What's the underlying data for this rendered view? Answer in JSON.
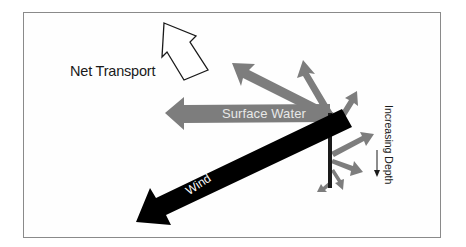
{
  "diagram": {
    "labels": {
      "net_transport": "Net Transport",
      "surface_water": "Surface Water",
      "wind": "Wind",
      "increasing_depth": "Increasing Depth"
    },
    "colors": {
      "frame_border": "#8a8a8a",
      "net_transport_outline": "#1a1a1a",
      "current_arrows": "#7d7d7d",
      "wind_arrow": "#000000",
      "depth_axis": "#1a1a1a",
      "text": "#1a1a1a",
      "surface_label_text": "#e8e8e8",
      "wind_label_text": "#ffffff"
    },
    "arrows": [
      {
        "name": "net-transport",
        "style": "outline",
        "direction": "up-left"
      },
      {
        "name": "wind",
        "style": "solid-black",
        "direction": "down-left"
      },
      {
        "name": "surface-water",
        "style": "solid-gray",
        "direction": "left"
      },
      {
        "name": "depth-layer-1",
        "style": "solid-gray",
        "direction": "up-left"
      },
      {
        "name": "depth-layer-2",
        "style": "solid-gray",
        "direction": "up"
      },
      {
        "name": "depth-layer-3",
        "style": "solid-gray",
        "direction": "up-right"
      },
      {
        "name": "depth-layer-4",
        "style": "solid-gray",
        "direction": "right"
      },
      {
        "name": "depth-layer-5",
        "style": "solid-gray",
        "direction": "right-down"
      },
      {
        "name": "depth-layer-6",
        "style": "solid-gray",
        "direction": "down"
      },
      {
        "name": "depth-layer-7",
        "style": "solid-gray",
        "direction": "down-left"
      }
    ]
  }
}
